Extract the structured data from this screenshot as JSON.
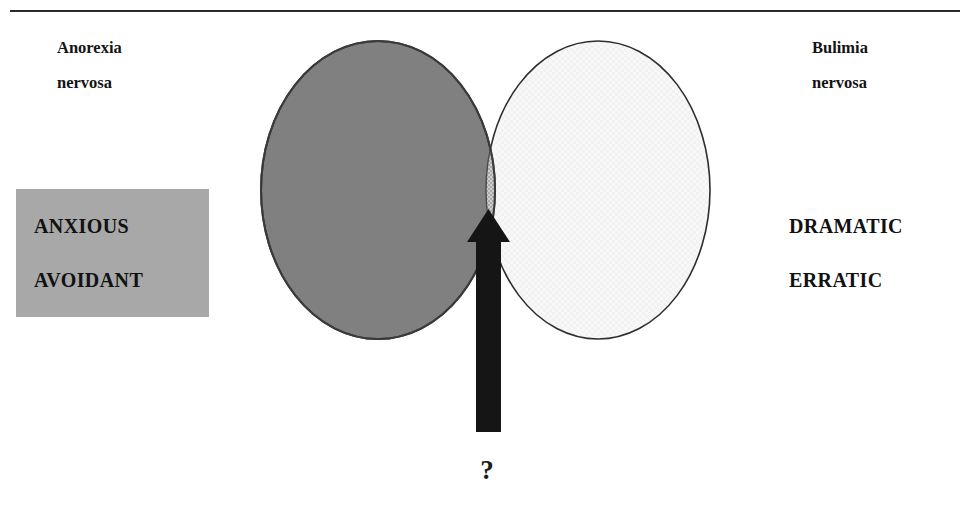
{
  "page": {
    "width": 968,
    "height": 509,
    "background": "#ffffff",
    "clipped_header_text": "",
    "divider_color": "#2b2b2b"
  },
  "diagram": {
    "type": "venn-2-set",
    "title": "",
    "left_set": {
      "label_lines": [
        "Anorexia",
        "nervosa"
      ],
      "fill": "#808080",
      "stroke": "#2e2e2e",
      "cx": 378,
      "cy": 190,
      "rx": 117,
      "ry": 149
    },
    "right_set": {
      "label_lines": [
        "Bulimia",
        "nervosa"
      ],
      "fill": "#f7f7f7",
      "stroke": "#2e2e2e",
      "cx": 598,
      "cy": 190,
      "rx": 112,
      "ry": 149
    },
    "intersection": {
      "label": "",
      "fill": "#bdbdbd",
      "pattern": "checkered"
    },
    "arrow": {
      "direction": "up",
      "color": "#151515",
      "target": "intersection",
      "tip_y": 209,
      "base_y": 432,
      "shaft_left": 476,
      "shaft_right": 501,
      "head_left": 467,
      "head_right": 510
    },
    "annotation": {
      "symbol": "?"
    }
  },
  "cluster_a": {
    "lines": [
      "ANXIOUS",
      "AVOIDANT"
    ],
    "box_fill": "#a8a8a8",
    "text_color": "#111111"
  },
  "cluster_b": {
    "lines": [
      "DRAMATIC",
      "ERRATIC"
    ],
    "box_fill": "transparent",
    "text_color": "#111111"
  }
}
